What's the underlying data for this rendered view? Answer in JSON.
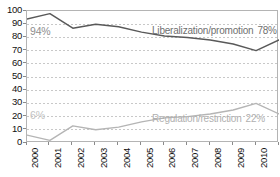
{
  "chart_data": {
    "type": "line",
    "title": "",
    "xlabel": "",
    "ylabel": "",
    "categories": [
      "2000",
      "2001",
      "2002",
      "2003",
      "2004",
      "2005",
      "2006",
      "2007",
      "2008",
      "2009",
      "2010",
      "2011"
    ],
    "x": [
      2000,
      2001,
      2002,
      2003,
      2004,
      2005,
      2006,
      2007,
      2008,
      2009,
      2010,
      2011
    ],
    "ylim": [
      0,
      100
    ],
    "yticks": [
      0,
      10,
      20,
      30,
      40,
      50,
      60,
      70,
      80,
      90,
      100
    ],
    "ytick_labels": [
      "0",
      "10",
      "20",
      "30",
      "40",
      "50",
      "60",
      "70",
      "80",
      "90",
      "100"
    ],
    "grid": true,
    "grid_style": "dashed-horizontal",
    "legend": "inline-annotation",
    "series": [
      {
        "name": "Liberalization/promotion",
        "color": "#595959",
        "values": [
          94,
          98,
          87,
          90,
          88,
          84,
          81,
          80,
          78,
          75,
          70,
          78
        ],
        "start_label": "94%",
        "end_label": "78%"
      },
      {
        "name": "Regulation/restriction",
        "color": "#b5b5b5",
        "values": [
          6,
          2,
          13,
          10,
          12,
          16,
          19,
          20,
          22,
          25,
          30,
          22
        ],
        "start_label": "6%",
        "end_label": "22%"
      }
    ],
    "annotations": [
      {
        "id": "top-left",
        "text": "94%"
      },
      {
        "id": "top-right",
        "text": "Liberalization/promotion",
        "value": "78%"
      },
      {
        "id": "bottom-left",
        "text": "6%"
      },
      {
        "id": "bottom-right",
        "text": "Regulation/restriction",
        "value": "22%"
      }
    ],
    "colors": {
      "series_liberalization": "#595959",
      "series_regulation": "#b5b5b5",
      "grid": "#c8c8c8",
      "frame": "#b4b4b4",
      "text": "#111111",
      "background": "#ffffff"
    }
  }
}
